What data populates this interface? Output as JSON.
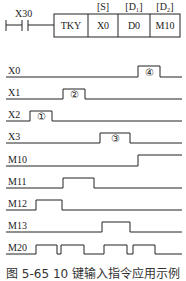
{
  "ladder": {
    "contact": "X30",
    "instruction": "TKY",
    "operand_headers": [
      "[S]",
      "[D₁]",
      "[D₂]"
    ],
    "operands": [
      "X0",
      "D0",
      "M10"
    ]
  },
  "timing": {
    "signals": [
      {
        "name": "X0",
        "marker": "④"
      },
      {
        "name": "X1",
        "marker": "②"
      },
      {
        "name": "X2",
        "marker": "①"
      },
      {
        "name": "X3",
        "marker": "③"
      },
      {
        "name": "M10",
        "marker": ""
      },
      {
        "name": "M11",
        "marker": ""
      },
      {
        "name": "M12",
        "marker": ""
      },
      {
        "name": "M13",
        "marker": ""
      },
      {
        "name": "M20",
        "marker": ""
      }
    ]
  },
  "caption": "图 5-65  10 键输入指令应用示例",
  "colors": {
    "line": "#222222",
    "background": "#ffffff"
  }
}
